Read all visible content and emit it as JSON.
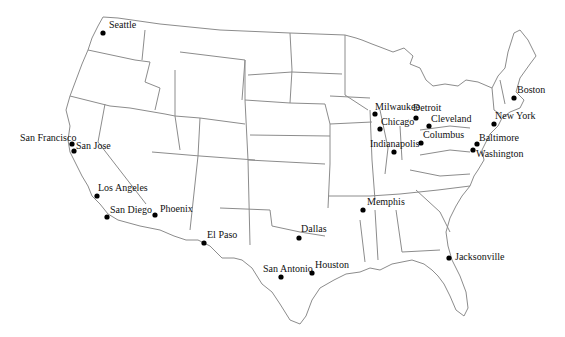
{
  "map": {
    "type": "US state outline map",
    "stroke_color": "#8c8c8c",
    "dot_color": "#000000"
  },
  "cities": [
    {
      "name": "Seattle",
      "x": 103,
      "y": 33,
      "lx": 109,
      "ly": 28
    },
    {
      "name": "San Francisco",
      "x": 72,
      "y": 144,
      "lx": 20,
      "ly": 141
    },
    {
      "name": "San Jose",
      "x": 74,
      "y": 151,
      "lx": 76,
      "ly": 149
    },
    {
      "name": "Los Angeles",
      "x": 97,
      "y": 196,
      "lx": 98,
      "ly": 191
    },
    {
      "name": "San Diego",
      "x": 107,
      "y": 217,
      "lx": 110,
      "ly": 213
    },
    {
      "name": "Phoenix",
      "x": 155,
      "y": 215,
      "lx": 160,
      "ly": 212
    },
    {
      "name": "El Paso",
      "x": 204,
      "y": 243,
      "lx": 207,
      "ly": 238
    },
    {
      "name": "Dallas",
      "x": 299,
      "y": 238,
      "lx": 301,
      "ly": 232
    },
    {
      "name": "San Antonio",
      "x": 281,
      "y": 277,
      "lx": 263,
      "ly": 272
    },
    {
      "name": "Houston",
      "x": 312,
      "y": 273,
      "lx": 315,
      "ly": 268
    },
    {
      "name": "Memphis",
      "x": 363,
      "y": 210,
      "lx": 367,
      "ly": 205
    },
    {
      "name": "Jacksonville",
      "x": 449,
      "y": 258,
      "lx": 455,
      "ly": 260
    },
    {
      "name": "Milwaukee",
      "x": 375,
      "y": 114,
      "lx": 375,
      "ly": 110
    },
    {
      "name": "Chicago",
      "x": 380,
      "y": 129,
      "lx": 381,
      "ly": 125
    },
    {
      "name": "Detroit",
      "x": 416,
      "y": 118,
      "lx": 413,
      "ly": 111
    },
    {
      "name": "Cleveland",
      "x": 429,
      "y": 126,
      "lx": 431,
      "ly": 122
    },
    {
      "name": "Columbus",
      "x": 421,
      "y": 143,
      "lx": 423,
      "ly": 138
    },
    {
      "name": "Indianapolis",
      "x": 394,
      "y": 152,
      "lx": 370,
      "ly": 147
    },
    {
      "name": "Boston",
      "x": 514,
      "y": 98,
      "lx": 517,
      "ly": 93
    },
    {
      "name": "New York",
      "x": 494,
      "y": 124,
      "lx": 495,
      "ly": 119
    },
    {
      "name": "Baltimore",
      "x": 477,
      "y": 144,
      "lx": 479,
      "ly": 141
    },
    {
      "name": "Washington",
      "x": 473,
      "y": 150,
      "lx": 476,
      "ly": 157
    }
  ]
}
